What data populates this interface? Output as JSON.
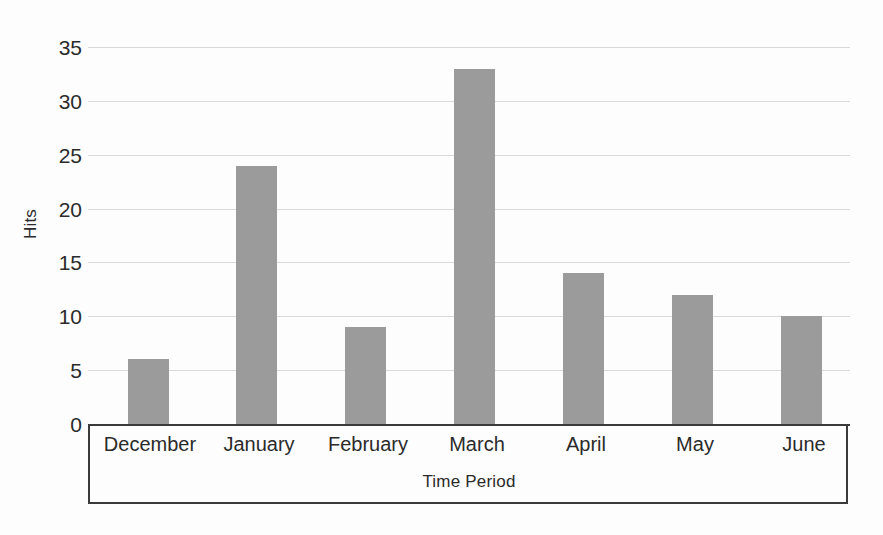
{
  "chart_data": {
    "type": "bar",
    "title": "",
    "subtitle": "",
    "xlabel": "Time Period",
    "ylabel": "Hits",
    "categories": [
      "December",
      "January",
      "February",
      "March",
      "April",
      "May",
      "June"
    ],
    "values": [
      6,
      24,
      9,
      33,
      14,
      12,
      10
    ],
    "series": [
      {
        "name": "Hits",
        "values": [
          6,
          24,
          9,
          33,
          14,
          12,
          10
        ]
      }
    ],
    "ylim": [
      0,
      35
    ],
    "ytick_labels": [
      "0",
      "5",
      "10",
      "15",
      "20",
      "25",
      "30",
      "35"
    ],
    "ytick_values": [
      0,
      5,
      10,
      15,
      20,
      25,
      30,
      35
    ],
    "grid": true,
    "grid_axis": "y",
    "legend": false,
    "legend_position": "none",
    "bar_color": "#9b9b9b",
    "gridline_color": "#d9d9d9",
    "axis_color": "#3a3a3a",
    "background_color": "#fdfdfd",
    "text_color": "#2b2b2b"
  }
}
